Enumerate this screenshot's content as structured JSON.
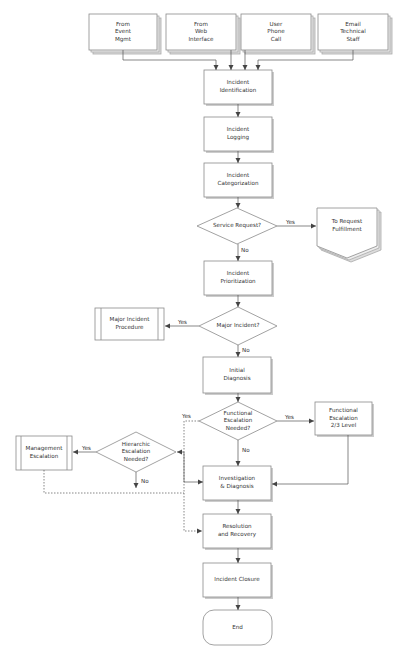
{
  "diagram": {
    "title_fragment": "",
    "sources": [
      {
        "id": "src1",
        "label": "From\nEvent\nMgmt"
      },
      {
        "id": "src2",
        "label": "From\nWeb\nInterface"
      },
      {
        "id": "src3",
        "label": "User\nPhone\nCall"
      },
      {
        "id": "src4",
        "label": "Email\nTechnical\nStaff"
      }
    ],
    "steps": {
      "identification": "Incident\nIdentification",
      "logging": "Incident\nLogging",
      "categorization": "Incident\nCategorization",
      "prioritization": "Incident\nPrioritization",
      "initial_diagnosis": "Initial\nDiagnosis",
      "investigation": "Investigation\n& Diagnosis",
      "resolution": "Resolution\nand Recovery",
      "closure": "Incident Closure",
      "end": "End"
    },
    "decisions": {
      "service_request": "Service Request?",
      "major_incident": "Major Incident?",
      "functional_escalation": "Functional\nEscalation\nNeeded?",
      "hierarchic_escalation": "Hierarchic\nEscalation\nNeeded?"
    },
    "side_nodes": {
      "request_fulfillment": "To Request\nFulfillment",
      "major_incident_procedure": "Major Incident\nProcedure",
      "functional_escalation_level": "Functional\nEscalation\n2/3 Level",
      "management_escalation": "Management\nEscalation"
    },
    "edge_labels": {
      "yes": "Yes",
      "no": "No"
    },
    "colors": {
      "stroke": "#7a7a7a",
      "shadow": "#c8c8c8",
      "fill": "#ffffff",
      "text": "#333333"
    }
  }
}
